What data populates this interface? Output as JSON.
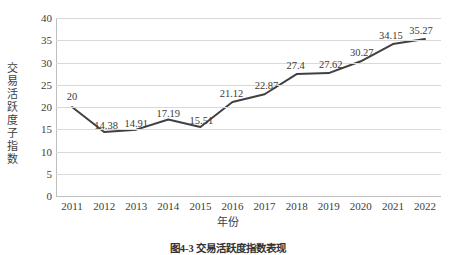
{
  "chart_data": {
    "type": "line",
    "title": "",
    "xlabel": "年份",
    "ylabel": "交易活跃度子指数",
    "categories": [
      "2011",
      "2012",
      "2013",
      "2014",
      "2015",
      "2016",
      "2017",
      "2018",
      "2019",
      "2020",
      "2021",
      "2022"
    ],
    "values": [
      20,
      14.38,
      14.91,
      17.19,
      15.51,
      21.12,
      22.87,
      27.4,
      27.62,
      30.27,
      34.15,
      35.27
    ],
    "point_labels": [
      "20",
      "14.38",
      "14.91",
      "17.19",
      "15.51",
      "21.12",
      "22.87",
      "27.4",
      "27.62",
      "30.27",
      "34.15",
      "35.27"
    ],
    "ylim": [
      0,
      40
    ],
    "y_ticks": [
      "0",
      "5",
      "10",
      "15",
      "20",
      "25",
      "30",
      "35",
      "40"
    ],
    "grid": true,
    "legend": "none",
    "series": [
      {
        "name": "交易活跃度子指数",
        "values": [
          20,
          14.38,
          14.91,
          17.19,
          15.51,
          21.12,
          22.87,
          27.4,
          27.62,
          30.27,
          34.15,
          35.27
        ]
      }
    ],
    "colors": {
      "line": "#404040",
      "gridline": "#d9d9d9",
      "axis": "#bfbfbf",
      "text": "#404040",
      "background": "#ffffff"
    }
  },
  "caption": {
    "text": "图4-3 交易活跃度指数表现"
  }
}
